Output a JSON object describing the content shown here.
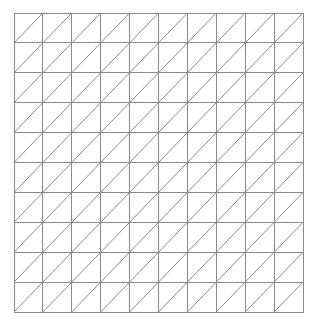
{
  "figure": {
    "kind": "geometric-grid-diagram",
    "background_color": "#ffffff"
  },
  "canvas": {
    "width": 317,
    "height": 326
  },
  "grid": {
    "rows": 10,
    "columns": 10,
    "cell_count": 100,
    "triangle_count": 200,
    "origin_x": 14,
    "origin_y": 13,
    "width": 289,
    "height": 299,
    "cell_width": 28.9,
    "cell_height": 29.9,
    "line_color": "#8a8a8a",
    "line_width": 1,
    "border_color": "#8a8a8a",
    "border_width": 1
  },
  "diagonals": {
    "direction": "bottom-left-to-top-right",
    "glyph": "/",
    "per_cell": 1,
    "color": "#8a8a8a",
    "line_width": 1
  },
  "chart_data": {
    "type": "table",
    "xlabel": "",
    "ylabel": "",
    "grid": true,
    "legend": "none",
    "columns": 10,
    "rows": 10,
    "categories": [
      "c1",
      "c2",
      "c3",
      "c4",
      "c5",
      "c6",
      "c7",
      "c8",
      "c9",
      "c10"
    ],
    "values": [
      10,
      10,
      10,
      10,
      10,
      10,
      10,
      10,
      10,
      10
    ],
    "annotations": []
  }
}
